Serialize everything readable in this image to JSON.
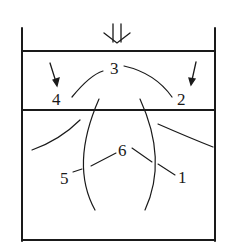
{
  "diagram": {
    "type": "flow-zones-in-container",
    "colors": {
      "stroke": "#1a1a1a",
      "background": "#ffffff"
    },
    "load_arrow": {
      "symbol": "double-down-arrow",
      "meaning": "applied load"
    },
    "labels": {
      "l1": "1",
      "l2": "2",
      "l3": "3",
      "l4": "4",
      "l5": "5",
      "l6": "6"
    }
  }
}
